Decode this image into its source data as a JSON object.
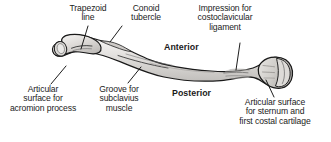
{
  "figure": {
    "bone_name": "clavicle",
    "view": "superior view, right clavicle",
    "colors": {
      "outline": "#1a1a1a",
      "bone_fill_light": "#f0efee",
      "bone_fill_mid": "#d8d6d4",
      "bone_fill_dark": "#bbb8b5",
      "text": "#1b1b1b",
      "background": "#ffffff",
      "leader_line": "#111111"
    }
  },
  "labels": {
    "trapezoid_line": "Trapezoid\nline",
    "conoid_tubercle": "Conoid\ntubercle",
    "impression_costoclavicular": "Impression for\ncostoclavicular\nligament",
    "anterior": "Anterior",
    "posterior": "Posterior",
    "articular_acromion": "Articular\nsurface for\nacromion process",
    "groove_subclavius": "Groove for\nsubclavius\nmuscle",
    "articular_sternum": "Articular surface\nfor sternum and\nfirst costal cartilage"
  },
  "leader_lines": [
    {
      "name": "trapezoid-line-leader",
      "from": [
        88,
        26
      ],
      "to": [
        81,
        49
      ]
    },
    {
      "name": "conoid-tubercle-leader",
      "from": [
        122,
        26
      ],
      "to": [
        110,
        42
      ]
    },
    {
      "name": "impression-leader",
      "from": [
        240,
        43
      ],
      "to": [
        236,
        70
      ]
    },
    {
      "name": "articular-acromion-leader",
      "from": [
        51,
        84
      ],
      "to": [
        66,
        66
      ]
    },
    {
      "name": "groove-subclavius-leader",
      "from": [
        128,
        83
      ],
      "to": [
        141,
        67
      ]
    },
    {
      "name": "articular-sternum-leader",
      "from": [
        274,
        97
      ],
      "to": [
        266,
        80
      ]
    }
  ]
}
